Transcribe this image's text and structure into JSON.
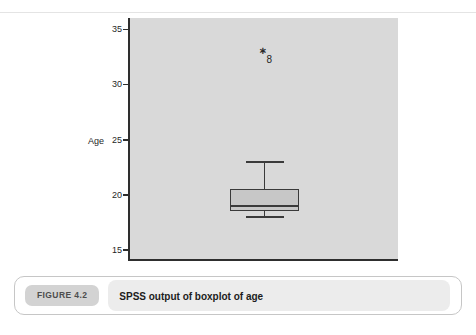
{
  "chart_data": {
    "type": "boxplot",
    "title": "",
    "xlabel": "",
    "ylabel": "Age",
    "ylim": [
      14,
      36
    ],
    "yticks": [
      15,
      20,
      25,
      30,
      35
    ],
    "grid": false,
    "plot_background": "#d9d9d9",
    "box_fill": "#c7c7c7",
    "line_color": "#3a3a3a",
    "series": [
      {
        "name": "Age",
        "whisker_min": 18,
        "q1": 18.5,
        "median": 19,
        "q3": 20.5,
        "whisker_max": 23,
        "outliers": [
          {
            "value": 33,
            "label": "8",
            "marker": "asterisk"
          }
        ]
      }
    ]
  },
  "caption": {
    "figure_label": "FIGURE 4.2",
    "text": "SPSS output of boxplot of age"
  }
}
